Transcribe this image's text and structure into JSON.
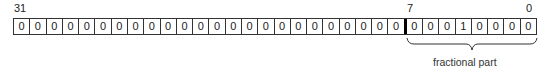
{
  "diagram": {
    "bit_labels": {
      "msb": "31",
      "fraction_msb": "7",
      "lsb": "0"
    },
    "bits": [
      "0",
      "0",
      "0",
      "0",
      "0",
      "0",
      "0",
      "0",
      "0",
      "0",
      "0",
      "0",
      "0",
      "0",
      "0",
      "0",
      "0",
      "0",
      "0",
      "0",
      "0",
      "0",
      "0",
      "0",
      "0",
      "0",
      "0",
      "1",
      "0",
      "0",
      "0",
      "0"
    ],
    "divider_after_index": 23,
    "brace": {
      "label": "fractional part",
      "spans_bits": "7-0"
    }
  }
}
